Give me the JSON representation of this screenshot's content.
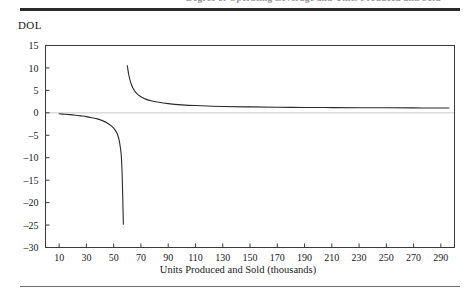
{
  "figure": {
    "caption_partial": "Degree of Operating Leverage and Units Produced and Sold",
    "y_axis_label": "DOL",
    "x_axis_title": "Units Produced and Sold (thousands)"
  },
  "colors": {
    "curve": "#2a2a2a",
    "frame": "#3a3a3a",
    "zero_line": "#c9c9c9",
    "rule_top": "#2b2b2b",
    "rule_bottom": "#6f6f6f",
    "background": "#ffffff"
  },
  "chart_data": {
    "type": "line",
    "title": "",
    "xlabel": "Units Produced and Sold (thousands)",
    "ylabel": "DOL",
    "xlim": [
      0,
      300
    ],
    "ylim": [
      -30,
      15
    ],
    "grid": false,
    "legend": "none",
    "x_ticks": [
      10,
      30,
      50,
      70,
      90,
      110,
      130,
      150,
      170,
      190,
      210,
      230,
      250,
      270,
      290
    ],
    "y_ticks": [
      15,
      10,
      5,
      0,
      -5,
      -10,
      -15,
      -20,
      -25,
      -30
    ],
    "zero_reference_line": 0,
    "break_even_units": 58,
    "series": [
      {
        "name": "DOL (below break-even)",
        "x": [
          10,
          14,
          18,
          22,
          26,
          30,
          34,
          38,
          42,
          45,
          48,
          50,
          52,
          53,
          54,
          55,
          55.6,
          56,
          56.3,
          56.6,
          56.9,
          57.1
        ],
        "y": [
          -0.21,
          -0.32,
          -0.41,
          -0.53,
          -0.68,
          -0.85,
          -1.08,
          -1.35,
          -1.78,
          -2.2,
          -2.85,
          -3.4,
          -4.3,
          -5.0,
          -6.1,
          -7.9,
          -9.6,
          -12.0,
          -14.5,
          -18.0,
          -22.0,
          -24.8
        ]
      },
      {
        "name": "DOL (above break-even)",
        "x": [
          60,
          61,
          62,
          63,
          64,
          66,
          68,
          70,
          74,
          78,
          82,
          90,
          100,
          110,
          130,
          150,
          170,
          190,
          210,
          230,
          250,
          270,
          290,
          296
        ],
        "y": [
          10.5,
          8.6,
          7.3,
          6.3,
          5.6,
          4.6,
          4.0,
          3.6,
          3.0,
          2.65,
          2.4,
          2.05,
          1.78,
          1.62,
          1.42,
          1.32,
          1.25,
          1.2,
          1.17,
          1.14,
          1.12,
          1.1,
          1.08,
          1.07
        ]
      }
    ]
  }
}
